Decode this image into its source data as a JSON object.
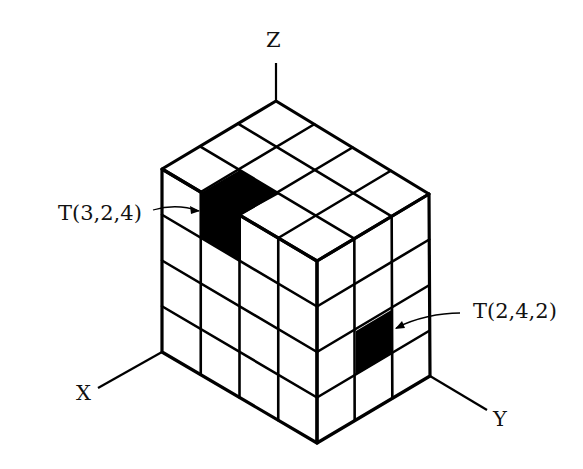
{
  "diagram": {
    "axes": {
      "x_label": "X",
      "y_label": "Y",
      "z_label": "Z"
    },
    "callouts": [
      {
        "label": "T(3,2,4)",
        "target": "top-left highlighted cube"
      },
      {
        "label": "T(2,4,2)",
        "target": "right-face highlighted cell"
      }
    ],
    "colors": {
      "line": "#000000",
      "highlight": "#000000",
      "background": "#ffffff"
    },
    "geometry": {
      "top_face": {
        "T": [
          276,
          101
        ],
        "L": [
          162,
          169
        ],
        "F": [
          317,
          261
        ],
        "R": [
          429,
          194
        ],
        "div_TL": 3,
        "div_TR": 4
      },
      "left_face": {
        "top_left": [
          162,
          169
        ],
        "top_right": [
          317,
          261
        ],
        "bottom_right": [
          317,
          443
        ],
        "bottom_left": [
          162,
          352
        ],
        "cols": 4,
        "rows": 4
      },
      "right_face": {
        "top_left": [
          317,
          261
        ],
        "top_right": [
          429,
          194
        ],
        "bottom_right": [
          430,
          376
        ],
        "bottom_left": [
          317,
          443
        ],
        "cols": 3,
        "rows": 4
      },
      "highlight_cells": [
        [
          [
            202,
            192
          ],
          [
            240,
            170
          ],
          [
            279,
            194
          ],
          [
            241,
            215
          ]
        ],
        [
          [
            201,
            192
          ],
          [
            241,
            215
          ],
          [
            241,
            262
          ],
          [
            201,
            238
          ]
        ],
        [
          [
            356,
            331
          ],
          [
            393,
            309
          ],
          [
            393,
            353
          ],
          [
            356,
            375
          ]
        ]
      ],
      "axis_lines": [
        {
          "name": "z-axis",
          "from": [
            276,
            101
          ],
          "to": [
            276,
            63
          ]
        },
        {
          "name": "x-axis",
          "from": [
            162,
            352
          ],
          "to": [
            98,
            388
          ]
        },
        {
          "name": "y-axis",
          "from": [
            430,
            376
          ],
          "to": [
            487,
            410
          ]
        }
      ]
    }
  }
}
